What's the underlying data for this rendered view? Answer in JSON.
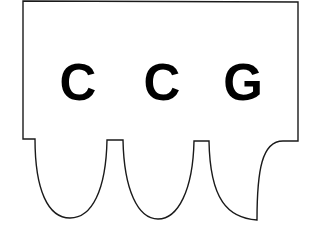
{
  "diagram": {
    "type": "codon-shape",
    "codon": {
      "bases": [
        {
          "letter": "C",
          "x": 78
        },
        {
          "letter": "C",
          "x": 162
        },
        {
          "letter": "G",
          "x": 243
        }
      ]
    },
    "colors": {
      "outline": "#1a1a1a",
      "fill": "#ffffff",
      "text": "#000000"
    }
  }
}
